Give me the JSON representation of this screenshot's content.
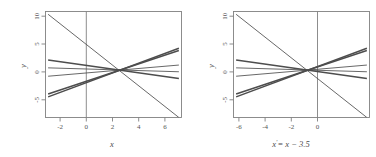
{
  "figure": {
    "type": "two-panel-line-plot",
    "background": "#ffffff",
    "line_color": "#4d4d4d",
    "axis_color": "#808080"
  },
  "chart_data": [
    {
      "type": "line",
      "panel": "left",
      "title": "",
      "xlabel": "x",
      "ylabel": "y",
      "xlim": [
        -3.2,
        7.2
      ],
      "ylim": [
        -8.5,
        10.5
      ],
      "xticks": [
        -2,
        0,
        2,
        4,
        6
      ],
      "xticklabels": [
        "-2",
        "0",
        "2",
        "4",
        "6"
      ],
      "yticks": [
        10,
        5,
        0,
        -5
      ],
      "yticklabels": [
        "10",
        "5",
        "0",
        "-5"
      ],
      "grid": false,
      "legend": false,
      "reference_lines": [
        {
          "orientation": "vertical",
          "x": 0
        }
      ],
      "annotations": [
        {
          "text": "lines converge near x = 2.5"
        }
      ],
      "series": [
        {
          "name": "line-1",
          "intercept": 5.1,
          "slope": -1.95,
          "x": [
            -3,
            7
          ],
          "y": [
            10.0,
            -8.5
          ]
        },
        {
          "name": "line-2",
          "intercept": 0.82,
          "slope": -0.33,
          "x": [
            -3,
            7
          ],
          "y": [
            1.8,
            -1.5
          ]
        },
        {
          "name": "line-3",
          "intercept": 0.18,
          "slope": -0.07,
          "x": [
            -3,
            7
          ],
          "y": [
            0.4,
            -0.3
          ]
        },
        {
          "name": "line-4",
          "intercept": -0.5,
          "slope": 0.2,
          "x": [
            -3,
            7
          ],
          "y": [
            -1.1,
            0.9
          ]
        },
        {
          "name": "line-5",
          "intercept": -1.95,
          "slope": 0.78,
          "x": [
            -3,
            7
          ],
          "y": [
            -4.3,
            3.5
          ]
        },
        {
          "name": "line-6",
          "intercept": -2.15,
          "slope": 0.86,
          "x": [
            -3,
            7
          ],
          "y": [
            -4.8,
            3.9
          ]
        }
      ]
    },
    {
      "type": "line",
      "panel": "right",
      "title": "",
      "xlabel": "x' = x − 3.5",
      "ylabel": "y",
      "xlim": [
        -6.7,
        3.7
      ],
      "ylim": [
        -8.5,
        10.5
      ],
      "xticks": [
        -6,
        -4,
        -2,
        0
      ],
      "xticklabels": [
        "-6",
        "-4",
        "-2",
        "0"
      ],
      "yticks": [
        10,
        5,
        0,
        -5
      ],
      "yticklabels": [
        "10",
        "5",
        "0",
        "-5"
      ],
      "grid": false,
      "legend": false,
      "reference_lines": [
        {
          "orientation": "vertical",
          "x": 0
        }
      ],
      "annotations": [
        {
          "text": "same lines, x shifted by -3.5"
        }
      ],
      "series": [
        {
          "name": "line-1",
          "x": [
            -6.5,
            3.5
          ],
          "y": [
            10.0,
            -8.5
          ]
        },
        {
          "name": "line-2",
          "x": [
            -6.5,
            3.5
          ],
          "y": [
            1.8,
            -1.5
          ]
        },
        {
          "name": "line-3",
          "x": [
            -6.5,
            3.5
          ],
          "y": [
            0.4,
            -0.3
          ]
        },
        {
          "name": "line-4",
          "x": [
            -6.5,
            3.5
          ],
          "y": [
            -1.1,
            0.9
          ]
        },
        {
          "name": "line-5",
          "x": [
            -6.5,
            3.5
          ],
          "y": [
            -4.3,
            3.5
          ]
        },
        {
          "name": "line-6",
          "x": [
            -6.5,
            3.5
          ],
          "y": [
            -4.8,
            3.9
          ]
        }
      ]
    }
  ],
  "labels": {
    "left_xlabel": "x",
    "left_ylabel": "y",
    "right_ylabel": "y",
    "right_xlabel_x": "x",
    "right_xlabel_prime": "′",
    "right_xlabel_rest": "= x − 3.5"
  }
}
